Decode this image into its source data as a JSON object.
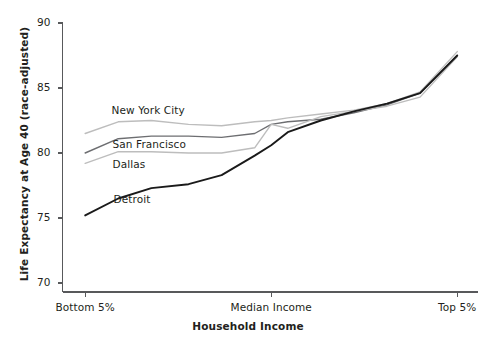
{
  "chart_data": {
    "type": "line",
    "title": "",
    "xlabel": "Household Income",
    "ylabel": "Life Expectancy at Age 40 (race-adjusted)",
    "grid": false,
    "legend_position": "inline-annotations",
    "ylim": [
      70,
      90
    ],
    "yticks": [
      70,
      75,
      80,
      85,
      90
    ],
    "ytick_labels": [
      "70",
      "75",
      "80",
      "85",
      "90"
    ],
    "xlim": [
      0,
      100
    ],
    "xticks": [
      5,
      50,
      95
    ],
    "xtick_labels": [
      "Bottom 5%",
      "Median Income",
      "Top 5%"
    ],
    "x": [
      5,
      13,
      21,
      30,
      38,
      46,
      50,
      54,
      62,
      70,
      78,
      86,
      95
    ],
    "series": [
      {
        "name": "New York City",
        "color": "#bdbdbd",
        "label_x_pct": 0.26,
        "label_y_value": 83.2,
        "values": [
          81.5,
          82.4,
          82.5,
          82.2,
          82.1,
          82.4,
          82.5,
          82.7,
          83.0,
          83.3,
          83.8,
          84.7,
          87.8
        ]
      },
      {
        "name": "San Francisco",
        "color": "#6d6e71",
        "label_x_pct": 0.27,
        "label_y_value": 80.6,
        "values": [
          80.0,
          81.1,
          81.3,
          81.3,
          81.2,
          81.5,
          82.2,
          82.4,
          82.6,
          83.1,
          83.7,
          84.6,
          87.5
        ]
      },
      {
        "name": "Dallas",
        "color": "#bdbdbd",
        "label_x_pct": 0.27,
        "label_y_value": 79.1,
        "values": [
          79.2,
          80.1,
          80.1,
          80.0,
          80.0,
          80.4,
          82.2,
          81.9,
          82.8,
          83.2,
          83.6,
          84.3,
          87.4
        ]
      },
      {
        "name": "Detroit",
        "color": "#1a1a1a",
        "label_x_pct": 0.28,
        "label_y_value": 76.4,
        "values": [
          75.2,
          76.5,
          77.3,
          77.6,
          78.3,
          79.8,
          80.6,
          81.6,
          82.5,
          83.2,
          83.8,
          84.6,
          87.5
        ]
      }
    ]
  }
}
